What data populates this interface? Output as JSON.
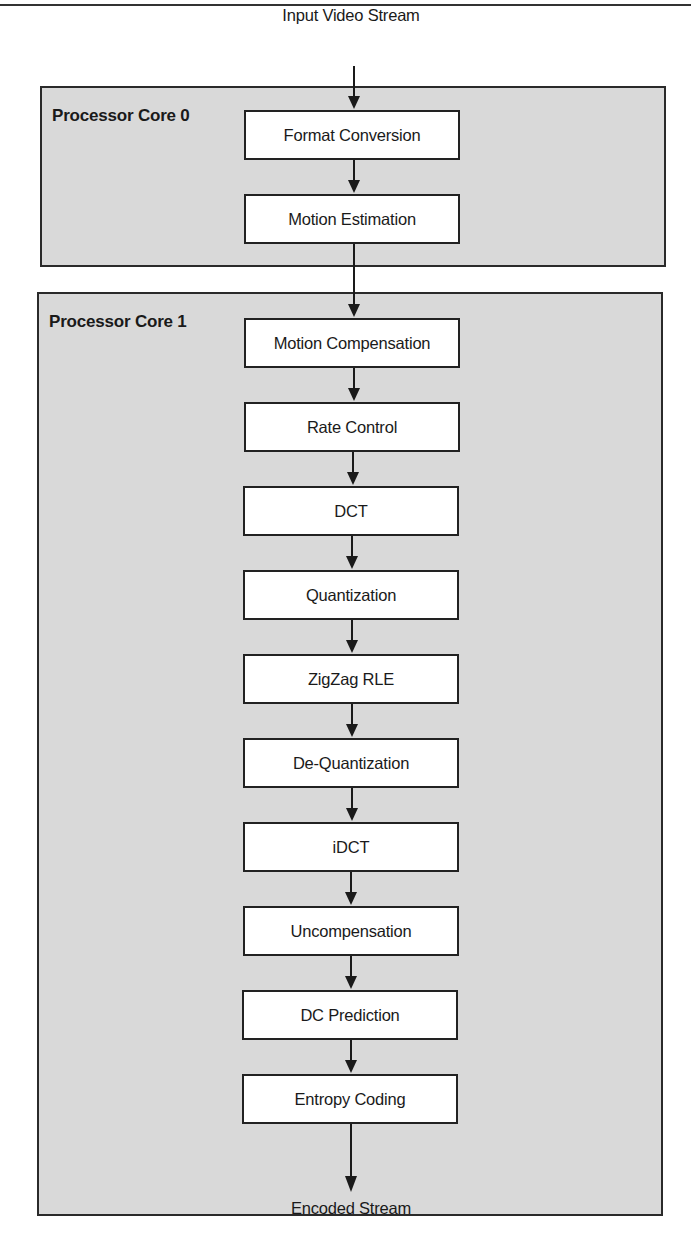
{
  "diagram": {
    "input_label": "Input Video Stream",
    "output_label": "Encoded Stream",
    "cores": [
      {
        "label": "Processor Core 0",
        "stages": [
          "Format Conversion",
          "Motion Estimation"
        ]
      },
      {
        "label": "Processor Core 1",
        "stages": [
          "Motion Compensation",
          "Rate Control",
          "DCT",
          "Quantization",
          "ZigZag RLE",
          "De-Quantization",
          "iDCT",
          "Uncompensation",
          "DC Prediction",
          "Entropy Coding"
        ]
      }
    ],
    "colors": {
      "core_fill": "#d9d9d9",
      "box_fill": "#ffffff",
      "stroke": "#222222"
    }
  }
}
